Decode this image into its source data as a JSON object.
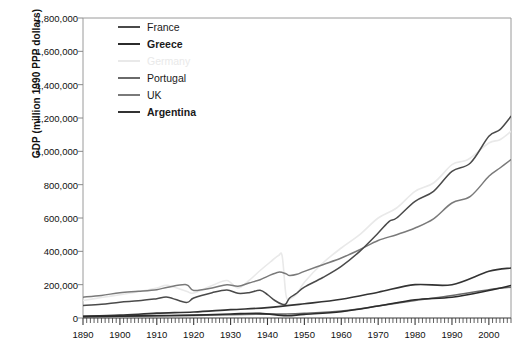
{
  "chart_data": {
    "type": "line",
    "title": "",
    "xlabel": "",
    "ylabel": "GDP (million 1990 PPP dollars)",
    "xlim": [
      1890,
      2006
    ],
    "ylim": [
      0,
      1800000
    ],
    "ytick_labels": [
      "0",
      "200,000",
      "400,000",
      "600,000",
      "800,000",
      "1,000,000",
      "1,200,000",
      "1,400,000",
      "1,600,000",
      "1,800,000"
    ],
    "ytick_values": [
      0,
      200000,
      400000,
      600000,
      800000,
      1000000,
      1200000,
      1400000,
      1600000,
      1800000
    ],
    "xtick_labels": [
      "1890",
      "1900",
      "1910",
      "1920",
      "1930",
      "1940",
      "1950",
      "1960",
      "1970",
      "1980",
      "1990",
      "2000"
    ],
    "xtick_values": [
      1890,
      1900,
      1910,
      1920,
      1930,
      1940,
      1950,
      1960,
      1970,
      1980,
      1990,
      2000
    ],
    "minor_x_step": 1,
    "grid": false,
    "legend_position": "top-left",
    "series": [
      {
        "name": "France",
        "color": "#4a4a4a",
        "width": 1.5,
        "x": [
          1890,
          1895,
          1900,
          1905,
          1910,
          1913,
          1918,
          1920,
          1925,
          1929,
          1932,
          1935,
          1938,
          1940,
          1942,
          1944,
          1945,
          1946,
          1948,
          1950,
          1955,
          1960,
          1965,
          1970,
          1973,
          1975,
          1980,
          1985,
          1990,
          1995,
          2000,
          2003,
          2006
        ],
        "values": [
          75000,
          82000,
          95000,
          103000,
          116000,
          125000,
          93000,
          120000,
          152000,
          168000,
          148000,
          152000,
          166000,
          140000,
          105000,
          82000,
          85000,
          120000,
          150000,
          185000,
          243000,
          310000,
          400000,
          510000,
          580000,
          600000,
          700000,
          760000,
          880000,
          930000,
          1090000,
          1130000,
          1210000
        ]
      },
      {
        "name": "Greece",
        "color": "#2b2b2b",
        "width": 1.6,
        "x": [
          1890,
          1900,
          1910,
          1920,
          1930,
          1938,
          1945,
          1950,
          1960,
          1970,
          1980,
          1990,
          2000,
          2006
        ],
        "values": [
          8000,
          11000,
          14000,
          17000,
          24000,
          28000,
          14000,
          22000,
          38000,
          72000,
          110000,
          125000,
          165000,
          195000
        ]
      },
      {
        "name": "Germany",
        "color": "#e9e9e9",
        "width": 1.6,
        "x": [
          1890,
          1895,
          1900,
          1905,
          1910,
          1913,
          1918,
          1920,
          1925,
          1929,
          1932,
          1935,
          1938,
          1941,
          1943,
          1944,
          1945,
          1946,
          1948,
          1950,
          1955,
          1960,
          1965,
          1970,
          1975,
          1980,
          1985,
          1990,
          1993,
          1995,
          2000,
          2003,
          2006
        ],
        "values": [
          105000,
          123000,
          140000,
          158000,
          180000,
          196000,
          160000,
          150000,
          195000,
          225000,
          180000,
          225000,
          285000,
          340000,
          375000,
          370000,
          140000,
          115000,
          145000,
          215000,
          330000,
          420000,
          500000,
          600000,
          660000,
          760000,
          810000,
          920000,
          940000,
          960000,
          1050000,
          1070000,
          1120000
        ]
      },
      {
        "name": "Portugal",
        "color": "#6a6a6a",
        "width": 1.5,
        "x": [
          1890,
          1900,
          1910,
          1920,
          1930,
          1938,
          1945,
          1950,
          1960,
          1970,
          1980,
          1990,
          2000,
          2006
        ],
        "values": [
          9000,
          11000,
          13000,
          15000,
          19000,
          23000,
          24000,
          28000,
          42000,
          72000,
          105000,
          135000,
          170000,
          185000
        ]
      },
      {
        "name": "UK",
        "color": "#7a7a7a",
        "width": 1.5,
        "x": [
          1890,
          1895,
          1900,
          1905,
          1910,
          1913,
          1918,
          1920,
          1925,
          1929,
          1932,
          1935,
          1938,
          1940,
          1943,
          1945,
          1946,
          1948,
          1950,
          1955,
          1960,
          1965,
          1970,
          1975,
          1980,
          1985,
          1990,
          1995,
          2000,
          2003,
          2006
        ],
        "values": [
          125000,
          135000,
          152000,
          160000,
          170000,
          185000,
          200000,
          165000,
          180000,
          200000,
          190000,
          210000,
          230000,
          250000,
          275000,
          265000,
          255000,
          262000,
          280000,
          320000,
          360000,
          410000,
          465000,
          500000,
          540000,
          595000,
          690000,
          730000,
          850000,
          900000,
          950000
        ]
      },
      {
        "name": "Argentina",
        "color": "#333333",
        "width": 1.6,
        "x": [
          1890,
          1900,
          1910,
          1920,
          1930,
          1940,
          1950,
          1960,
          1970,
          1980,
          1990,
          2000,
          2006
        ],
        "values": [
          10000,
          17000,
          29000,
          36000,
          50000,
          62000,
          85000,
          112000,
          155000,
          200000,
          200000,
          280000,
          300000
        ]
      }
    ]
  },
  "legend": {
    "items": [
      {
        "label": "France"
      },
      {
        "label": "Greece"
      },
      {
        "label": "Germany"
      },
      {
        "label": "Portugal"
      },
      {
        "label": "UK"
      },
      {
        "label": "Argentina"
      }
    ]
  }
}
